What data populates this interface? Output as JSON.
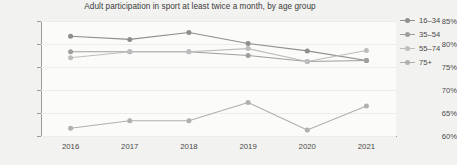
{
  "chart_data": {
    "type": "line",
    "title": "Adult participation in sport at least twice a month, by age group",
    "xlabel": "",
    "ylabel": "",
    "categories": [
      "2016",
      "2017",
      "2018",
      "2019",
      "2020",
      "2021"
    ],
    "ylim": [
      60,
      85
    ],
    "ytick_labels": [
      "60%",
      "65%",
      "70%",
      "75%",
      "80%",
      "85%"
    ],
    "ytick_values": [
      60,
      65,
      70,
      75,
      80,
      85
    ],
    "grid": true,
    "legend_position": "right",
    "series": [
      {
        "name": "16–34",
        "color": "#8e8e8e",
        "values": [
          81.7,
          81.0,
          82.5,
          80.1,
          78.5,
          76.4
        ]
      },
      {
        "name": "35–54",
        "color": "#9e9e9e",
        "values": [
          78.3,
          78.3,
          78.3,
          77.5,
          76.2,
          76.4
        ]
      },
      {
        "name": "55–74",
        "color": "#bdbdbd",
        "values": [
          77.0,
          78.3,
          78.3,
          79.0,
          76.2,
          78.6
        ]
      },
      {
        "name": "75+",
        "color": "#b0b0b0",
        "values": [
          61.7,
          63.3,
          63.3,
          67.3,
          61.3,
          66.5
        ]
      }
    ]
  },
  "icons": {
    "legend_marker": "circle-marker-icon"
  }
}
